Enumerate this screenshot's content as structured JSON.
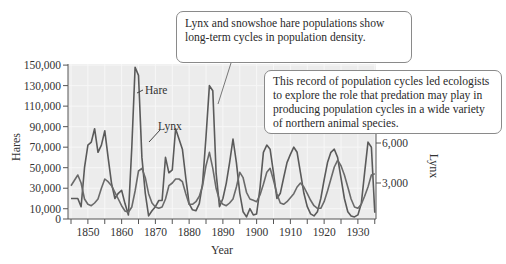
{
  "chart_data": {
    "type": "line",
    "title": "",
    "xlabel": "Year",
    "ylabel": "Hares",
    "ylabel_right": "Lynx",
    "xlim": [
      1845,
      1935
    ],
    "ylim": [
      0,
      155000
    ],
    "ylim_right": [
      0,
      7000
    ],
    "grid": true,
    "x_ticks": [
      1850,
      1860,
      1870,
      1880,
      1890,
      1900,
      1910,
      1920,
      1930
    ],
    "y_ticks": [
      "0",
      "10,000",
      "30,000",
      "50,000",
      "70,000",
      "90,000",
      "110,000",
      "130,000",
      "150,000"
    ],
    "y_ticks_right": [
      "3,000",
      "6,000"
    ],
    "series": [
      {
        "name": "Hare",
        "axis": "left",
        "x": [
          1845,
          1847,
          1848,
          1849,
          1850,
          1851,
          1852,
          1853,
          1854,
          1855,
          1856,
          1857,
          1858,
          1859,
          1860,
          1861,
          1862,
          1863,
          1864,
          1865,
          1866,
          1867,
          1868,
          1869,
          1870,
          1871,
          1872,
          1873,
          1874,
          1875,
          1876,
          1877,
          1878,
          1879,
          1880,
          1881,
          1882,
          1883,
          1884,
          1885,
          1886,
          1887,
          1888,
          1889,
          1890,
          1891,
          1892,
          1893,
          1894,
          1895,
          1896,
          1897,
          1898,
          1899,
          1900,
          1901,
          1902,
          1903,
          1904,
          1905,
          1906,
          1907,
          1908,
          1909,
          1910,
          1911,
          1912,
          1913,
          1914,
          1915,
          1916,
          1917,
          1918,
          1919,
          1920,
          1921,
          1922,
          1923,
          1924,
          1925,
          1926,
          1927,
          1928,
          1929,
          1930,
          1931,
          1932,
          1933,
          1934,
          1935
        ],
        "values": [
          20000,
          20000,
          12000,
          50000,
          72000,
          75000,
          88000,
          65000,
          72000,
          86000,
          60000,
          35000,
          20000,
          25000,
          28000,
          15000,
          4000,
          70000,
          148000,
          140000,
          60000,
          25000,
          3000,
          8000,
          12000,
          18000,
          18000,
          60000,
          45000,
          48000,
          88000,
          78000,
          68000,
          40000,
          15000,
          9000,
          8000,
          15000,
          35000,
          80000,
          130000,
          125000,
          45000,
          12000,
          20000,
          35000,
          55000,
          78000,
          55000,
          25000,
          7000,
          2000,
          10000,
          4000,
          5000,
          30000,
          65000,
          72000,
          68000,
          45000,
          20000,
          25000,
          40000,
          55000,
          63000,
          70000,
          65000,
          45000,
          25000,
          12000,
          5000,
          3000,
          7000,
          20000,
          38000,
          55000,
          65000,
          68000,
          60000,
          40000,
          20000,
          7000,
          3000,
          2000,
          4000,
          15000,
          45000,
          75000,
          70000,
          6000
        ],
        "color": "#5a5a5a",
        "label_annotation": "Hare"
      },
      {
        "name": "Lynx",
        "axis": "right",
        "x": [
          1845,
          1847,
          1848,
          1849,
          1850,
          1851,
          1852,
          1853,
          1854,
          1855,
          1856,
          1857,
          1858,
          1859,
          1860,
          1861,
          1862,
          1863,
          1864,
          1865,
          1866,
          1867,
          1868,
          1869,
          1870,
          1871,
          1872,
          1873,
          1874,
          1875,
          1876,
          1877,
          1878,
          1879,
          1880,
          1881,
          1882,
          1883,
          1884,
          1885,
          1886,
          1887,
          1888,
          1889,
          1890,
          1891,
          1892,
          1893,
          1894,
          1895,
          1896,
          1897,
          1898,
          1899,
          1900,
          1901,
          1902,
          1903,
          1904,
          1905,
          1906,
          1907,
          1908,
          1909,
          1910,
          1911,
          1912,
          1913,
          1914,
          1915,
          1916,
          1917,
          1918,
          1919,
          1920,
          1921,
          1922,
          1923,
          1924,
          1925,
          1926,
          1927,
          1928,
          1929,
          1930,
          1931,
          1932,
          1933,
          1934,
          1935
        ],
        "values": [
          2800,
          3600,
          3000,
          1800,
          1400,
          1300,
          1500,
          1800,
          2600,
          3300,
          3100,
          2800,
          2300,
          1800,
          1300,
          900,
          800,
          1200,
          2400,
          3900,
          4100,
          3400,
          2200,
          1500,
          1200,
          1100,
          1200,
          1800,
          2800,
          3000,
          3300,
          3300,
          3100,
          2200,
          1400,
          1400,
          1600,
          2000,
          2800,
          4300,
          5300,
          4100,
          2600,
          1700,
          1400,
          1300,
          1500,
          1800,
          2700,
          3800,
          3400,
          2300,
          1800,
          1700,
          1600,
          2100,
          2900,
          3800,
          4100,
          3200,
          2200,
          1500,
          1400,
          1600,
          1900,
          2200,
          2700,
          3000,
          2700,
          2200,
          1700,
          1300,
          1100,
          1100,
          1600,
          2400,
          3300,
          4200,
          4700,
          4300,
          3600,
          2700,
          1800,
          1200,
          1100,
          1400,
          2000,
          2700,
          3600,
          3700
        ],
        "color": "#6a6a6a",
        "label_annotation": "Lynx"
      }
    ],
    "annotations": [
      "Lynx and snowshoe hare populations show long-term cycles in population density.",
      "This record of population cycles led ecologists to explore the role that predation may play in producing population cycles in a wide variety of northern animal species."
    ]
  },
  "labels": {
    "y_axis_left": "Hares",
    "y_axis_right": "Lynx",
    "x_axis": "Year",
    "hare_label": "Hare",
    "lynx_label": "Lynx"
  },
  "callouts": {
    "top": "Lynx and snowshoe hare populations show long-term cycles in population density.",
    "right": "This record of population cycles led ecologists to explore the role that predation may play in producing population cycles in a wide variety of northern animal species."
  }
}
